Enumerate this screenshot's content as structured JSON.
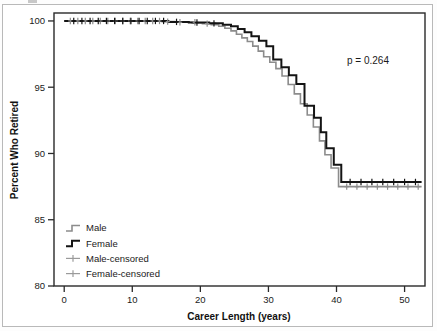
{
  "figure": {
    "background_color": "#ffffff",
    "border_color": "#b9b9b9"
  },
  "chart_data": {
    "type": "line",
    "subtype": "kaplan-meier-step",
    "title": "",
    "xlabel": "Career Length (years)",
    "ylabel": "Percent Who Retired",
    "xlim": [
      -1.5,
      53
    ],
    "ylim": [
      80,
      100.6
    ],
    "xticks": [
      0,
      10,
      20,
      30,
      40,
      50
    ],
    "xtick_labels": [
      "0",
      "10",
      "20",
      "30",
      "40",
      "50"
    ],
    "yticks": [
      80,
      85,
      90,
      95,
      100
    ],
    "ytick_labels": [
      "80",
      "85",
      "90",
      "95",
      "100"
    ],
    "grid": false,
    "legend_position": "lower-left-inside",
    "annotations": [
      {
        "name": "p-value",
        "text": "p = 0.264",
        "x": 43.5,
        "y": 97.6
      }
    ],
    "series": [
      {
        "name": "Male",
        "color": "#8c8c8c",
        "line_width": 1.6,
        "points": [
          [
            0,
            100.0
          ],
          [
            14.2,
            100.0
          ],
          [
            14.4,
            99.95
          ],
          [
            16.0,
            99.95
          ],
          [
            16.2,
            99.9
          ],
          [
            18.5,
            99.9
          ],
          [
            18.8,
            99.85
          ],
          [
            20.0,
            99.85
          ],
          [
            20.3,
            99.8
          ],
          [
            21.3,
            99.8
          ],
          [
            21.6,
            99.72
          ],
          [
            22.4,
            99.72
          ],
          [
            22.7,
            99.6
          ],
          [
            23.3,
            99.6
          ],
          [
            23.6,
            99.45
          ],
          [
            24.2,
            99.45
          ],
          [
            24.5,
            99.25
          ],
          [
            25.0,
            99.25
          ],
          [
            25.3,
            99.0
          ],
          [
            25.8,
            99.0
          ],
          [
            26.1,
            98.72
          ],
          [
            26.6,
            98.72
          ],
          [
            26.9,
            98.45
          ],
          [
            27.4,
            98.45
          ],
          [
            27.7,
            98.1
          ],
          [
            28.2,
            98.1
          ],
          [
            28.5,
            97.72
          ],
          [
            29.0,
            97.72
          ],
          [
            29.3,
            97.3
          ],
          [
            29.9,
            97.3
          ],
          [
            30.2,
            96.88
          ],
          [
            30.8,
            96.88
          ],
          [
            31.1,
            96.4
          ],
          [
            31.7,
            96.4
          ],
          [
            32.0,
            95.85
          ],
          [
            32.6,
            95.85
          ],
          [
            32.9,
            95.2
          ],
          [
            33.5,
            95.2
          ],
          [
            33.8,
            94.5
          ],
          [
            34.4,
            94.5
          ],
          [
            34.7,
            93.75
          ],
          [
            35.4,
            93.75
          ],
          [
            35.7,
            92.9
          ],
          [
            36.3,
            92.9
          ],
          [
            36.6,
            92.0
          ],
          [
            37.2,
            92.0
          ],
          [
            37.5,
            90.95
          ],
          [
            38.0,
            90.95
          ],
          [
            38.3,
            89.9
          ],
          [
            38.9,
            89.9
          ],
          [
            39.2,
            88.9
          ],
          [
            40.0,
            88.9
          ],
          [
            40.3,
            87.5
          ],
          [
            52.5,
            87.5
          ]
        ],
        "censor_marks": [
          [
            0.9,
            100.0
          ],
          [
            2.0,
            100.0
          ],
          [
            3.1,
            100.0
          ],
          [
            4.2,
            100.0
          ],
          [
            5.3,
            100.0
          ],
          [
            6.4,
            100.0
          ],
          [
            7.5,
            100.0
          ],
          [
            8.6,
            100.0
          ],
          [
            9.7,
            100.0
          ],
          [
            10.8,
            100.0
          ],
          [
            11.9,
            100.0
          ],
          [
            13.0,
            100.0
          ],
          [
            14.0,
            100.0
          ],
          [
            15.2,
            99.95
          ],
          [
            17.0,
            99.9
          ],
          [
            19.2,
            99.9
          ],
          [
            21.0,
            99.8
          ],
          [
            41.5,
            87.5
          ],
          [
            43.0,
            87.5
          ],
          [
            44.5,
            87.5
          ],
          [
            46.0,
            87.5
          ],
          [
            47.5,
            87.5
          ],
          [
            49.0,
            87.5
          ],
          [
            50.5,
            87.5
          ],
          [
            52.0,
            87.5
          ]
        ]
      },
      {
        "name": "Female",
        "color": "#141414",
        "line_width": 2.0,
        "points": [
          [
            0,
            100.0
          ],
          [
            15.0,
            100.0
          ],
          [
            15.3,
            99.93
          ],
          [
            18.0,
            99.93
          ],
          [
            18.3,
            99.88
          ],
          [
            21.0,
            99.88
          ],
          [
            21.3,
            99.82
          ],
          [
            23.0,
            99.82
          ],
          [
            23.3,
            99.72
          ],
          [
            24.2,
            99.72
          ],
          [
            24.5,
            99.6
          ],
          [
            25.2,
            99.6
          ],
          [
            25.5,
            99.4
          ],
          [
            26.2,
            99.4
          ],
          [
            26.5,
            99.15
          ],
          [
            27.2,
            99.15
          ],
          [
            27.5,
            98.85
          ],
          [
            28.3,
            98.85
          ],
          [
            28.6,
            98.5
          ],
          [
            29.4,
            98.5
          ],
          [
            29.7,
            98.1
          ],
          [
            30.4,
            98.1
          ],
          [
            30.7,
            97.1
          ],
          [
            31.6,
            97.1
          ],
          [
            31.9,
            96.5
          ],
          [
            32.7,
            96.5
          ],
          [
            33.0,
            95.9
          ],
          [
            33.8,
            95.9
          ],
          [
            34.1,
            95.25
          ],
          [
            35.0,
            95.25
          ],
          [
            35.3,
            93.6
          ],
          [
            36.4,
            93.6
          ],
          [
            36.7,
            92.7
          ],
          [
            37.4,
            92.7
          ],
          [
            37.7,
            91.6
          ],
          [
            38.2,
            91.6
          ],
          [
            38.5,
            90.4
          ],
          [
            39.3,
            90.4
          ],
          [
            39.6,
            89.15
          ],
          [
            40.4,
            89.15
          ],
          [
            40.7,
            87.85
          ],
          [
            52.5,
            87.85
          ]
        ],
        "censor_marks": [
          [
            1.4,
            100.0
          ],
          [
            2.6,
            100.0
          ],
          [
            3.8,
            100.0
          ],
          [
            5.0,
            100.0
          ],
          [
            6.2,
            100.0
          ],
          [
            7.4,
            100.0
          ],
          [
            8.6,
            100.0
          ],
          [
            9.8,
            100.0
          ],
          [
            11.0,
            100.0
          ],
          [
            12.2,
            100.0
          ],
          [
            13.4,
            100.0
          ],
          [
            14.6,
            100.0
          ],
          [
            16.5,
            99.93
          ],
          [
            19.5,
            99.88
          ],
          [
            22.0,
            99.82
          ],
          [
            42.0,
            87.85
          ],
          [
            43.6,
            87.85
          ],
          [
            45.2,
            87.85
          ],
          [
            46.8,
            87.85
          ],
          [
            48.4,
            87.85
          ],
          [
            50.0,
            87.85
          ],
          [
            51.6,
            87.85
          ]
        ]
      }
    ],
    "legend": [
      {
        "label": "Male",
        "marker": "step-line",
        "color": "#8c8c8c"
      },
      {
        "label": "Female",
        "marker": "step-line",
        "color": "#141414"
      },
      {
        "label": "Male-censored",
        "marker": "plus",
        "color": "#9a9a9a"
      },
      {
        "label": "Female-censored",
        "marker": "plus",
        "color": "#9a9a9a"
      }
    ]
  }
}
